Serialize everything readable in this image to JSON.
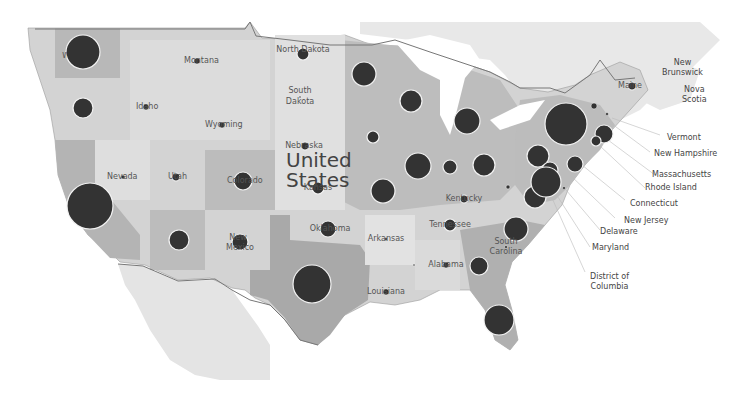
{
  "map": {
    "country_label_line1": "United",
    "country_label_line2": "States",
    "colors": {
      "background": "#ffffff",
      "land_neighbor": "#e6e6e6",
      "state_light": "#d8d8d8",
      "state_mid": "#bdbdbd",
      "state_dark": "#a8a8a8",
      "bubble_fill": "#333333",
      "bubble_stroke": "#f2f2f2",
      "border": "#7a7a7a"
    },
    "foreign_labels": [
      {
        "name": "New Brunswick",
        "l1": "New",
        "l2": "Brunswick"
      },
      {
        "name": "Nova Scotia",
        "l1": "Nova",
        "l2": "Scotia"
      }
    ],
    "callouts": [
      {
        "label": "Vermont"
      },
      {
        "label": "New Hampshire"
      },
      {
        "label": "Massachusetts"
      },
      {
        "label": "Rhode Island"
      },
      {
        "label": "Connecticut"
      },
      {
        "label": "New Jersey"
      },
      {
        "label": "Delaware"
      },
      {
        "label": "Maryland"
      },
      {
        "label": "District of"
      },
      {
        "label": "Columbia"
      }
    ],
    "state_labels": [
      {
        "name": "Washington",
        "text": "Washington"
      },
      {
        "name": "Oregon",
        "text": "Oregon"
      },
      {
        "name": "Idaho",
        "text": "Idaho"
      },
      {
        "name": "Montana",
        "text": "Montana"
      },
      {
        "name": "Wyoming",
        "text": "Wyoming"
      },
      {
        "name": "Nevada",
        "text": "Nevada"
      },
      {
        "name": "Utah",
        "text": "Utah"
      },
      {
        "name": "Colorado",
        "text": "Colorado"
      },
      {
        "name": "North Dakota",
        "text": "North Dakota"
      },
      {
        "name": "South Dakota l1",
        "text": "South"
      },
      {
        "name": "South Dakota l2",
        "text": "Dakota"
      },
      {
        "name": "Nebraska",
        "text": "Nebraska"
      },
      {
        "name": "Kansas",
        "text": "Kansas"
      },
      {
        "name": "Oklahoma",
        "text": "Oklahoma"
      },
      {
        "name": "Arkansas",
        "text": "Arkansas"
      },
      {
        "name": "Louisiana",
        "text": "Louisiana"
      },
      {
        "name": "Alabama",
        "text": "Alabama"
      },
      {
        "name": "Tennessee",
        "text": "Tennessee"
      },
      {
        "name": "Kentucky",
        "text": "Kentucky"
      },
      {
        "name": "South Carolina l1",
        "text": "South"
      },
      {
        "name": "South Carolina l2",
        "text": "Carolina"
      },
      {
        "name": "Maine",
        "text": "Maine"
      },
      {
        "name": "New Mexico l1",
        "text": "New"
      },
      {
        "name": "New Mexico l2",
        "text": "Mexico"
      },
      {
        "name": "Minnesota",
        "text": "Minnesota"
      },
      {
        "name": "Wisconsin",
        "text": "Wisconsin"
      },
      {
        "name": "Arizona",
        "text": "Arizona"
      }
    ],
    "bubbles": [
      {
        "state": "Washington",
        "x": 83,
        "y": 52,
        "r": 17
      },
      {
        "state": "Oregon",
        "x": 83,
        "y": 108,
        "r": 10
      },
      {
        "state": "Idaho",
        "x": 146,
        "y": 107,
        "r": 3
      },
      {
        "state": "Montana",
        "x": 197,
        "y": 61,
        "r": 3
      },
      {
        "state": "Wyoming",
        "x": 222,
        "y": 125,
        "r": 3
      },
      {
        "state": "California",
        "x": 90,
        "y": 206,
        "r": 23
      },
      {
        "state": "Nevada",
        "x": 123,
        "y": 177,
        "r": 2
      },
      {
        "state": "Utah",
        "x": 176,
        "y": 177,
        "r": 4
      },
      {
        "state": "Arizona",
        "x": 179,
        "y": 240,
        "r": 10
      },
      {
        "state": "Colorado",
        "x": 243,
        "y": 181,
        "r": 9
      },
      {
        "state": "New Mexico",
        "x": 240,
        "y": 242,
        "r": 8
      },
      {
        "state": "North Dakota",
        "x": 303,
        "y": 54,
        "r": 6
      },
      {
        "state": "South Dakota",
        "x": 300,
        "y": 97,
        "r": 1
      },
      {
        "state": "Nebraska",
        "x": 305,
        "y": 146,
        "r": 4
      },
      {
        "state": "Kansas",
        "x": 318,
        "y": 188,
        "r": 6
      },
      {
        "state": "Oklahoma",
        "x": 328,
        "y": 229,
        "r": 8
      },
      {
        "state": "Texas",
        "x": 312,
        "y": 284,
        "r": 19
      },
      {
        "state": "Minnesota",
        "x": 364,
        "y": 74,
        "r": 12
      },
      {
        "state": "Iowa",
        "x": 373,
        "y": 137,
        "r": 6
      },
      {
        "state": "Missouri",
        "x": 383,
        "y": 191,
        "r": 12
      },
      {
        "state": "Arkansas",
        "x": 386,
        "y": 239,
        "r": 1.5
      },
      {
        "state": "Louisiana",
        "x": 386,
        "y": 292,
        "r": 3
      },
      {
        "state": "Wisconsin",
        "x": 411,
        "y": 101,
        "r": 11
      },
      {
        "state": "Illinois",
        "x": 418,
        "y": 166,
        "r": 13
      },
      {
        "state": "Indiana",
        "x": 450,
        "y": 167,
        "r": 7
      },
      {
        "state": "Michigan",
        "x": 467,
        "y": 121,
        "r": 13
      },
      {
        "state": "Ohio",
        "x": 484,
        "y": 165,
        "r": 11
      },
      {
        "state": "Kentucky",
        "x": 464,
        "y": 199,
        "r": 4
      },
      {
        "state": "Tennessee",
        "x": 450,
        "y": 225,
        "r": 6
      },
      {
        "state": "Mississippi",
        "x": 414,
        "y": 265,
        "r": 1
      },
      {
        "state": "Alabama",
        "x": 446,
        "y": 265,
        "r": 3
      },
      {
        "state": "Georgia",
        "x": 479,
        "y": 266,
        "r": 9
      },
      {
        "state": "South Carolina",
        "x": 506,
        "y": 247,
        "r": 1.5
      },
      {
        "state": "North Carolina",
        "x": 516,
        "y": 229,
        "r": 12
      },
      {
        "state": "Florida",
        "x": 499,
        "y": 320,
        "r": 15
      },
      {
        "state": "Virginia",
        "x": 535,
        "y": 197,
        "r": 11
      },
      {
        "state": "West Virginia",
        "x": 508,
        "y": 187,
        "r": 2
      },
      {
        "state": "Pennsylvania",
        "x": 538,
        "y": 156,
        "r": 11
      },
      {
        "state": "New Jersey",
        "x": 550,
        "y": 170,
        "r": 8
      },
      {
        "state": "Maryland",
        "x": 546,
        "y": 182,
        "r": 15
      },
      {
        "state": "Delaware",
        "x": 564,
        "y": 188,
        "r": 1.5
      },
      {
        "state": "New York",
        "x": 566,
        "y": 124,
        "r": 21
      },
      {
        "state": "Connecticut",
        "x": 575,
        "y": 164,
        "r": 8
      },
      {
        "state": "Massachusetts",
        "x": 604,
        "y": 134,
        "r": 9
      },
      {
        "state": "Rhode Island",
        "x": 596,
        "y": 141,
        "r": 5
      },
      {
        "state": "Vermont",
        "x": 594,
        "y": 106,
        "r": 3
      },
      {
        "state": "New Hampshire",
        "x": 607,
        "y": 114,
        "r": 1.5
      },
      {
        "state": "Maine",
        "x": 632,
        "y": 86,
        "r": 4
      }
    ]
  }
}
